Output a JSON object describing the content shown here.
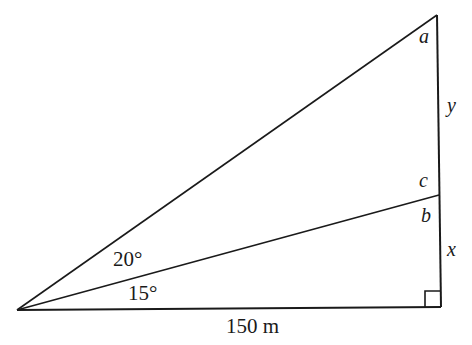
{
  "diagram": {
    "type": "right-triangle-trigonometry",
    "vertices": {
      "left": {
        "x": 17,
        "y": 310
      },
      "top": {
        "x": 437,
        "y": 15
      },
      "middle": {
        "x": 439,
        "y": 195
      },
      "bottom_right": {
        "x": 441,
        "y": 307
      }
    },
    "labels": {
      "angle_a": "a",
      "angle_c": "c",
      "angle_b": "b",
      "side_y": "y",
      "side_x": "x",
      "angle_upper": "20°",
      "angle_lower": "15°",
      "base_length": "150 m"
    },
    "line_color": "#1a1a1a",
    "right_angle_marker": true
  }
}
